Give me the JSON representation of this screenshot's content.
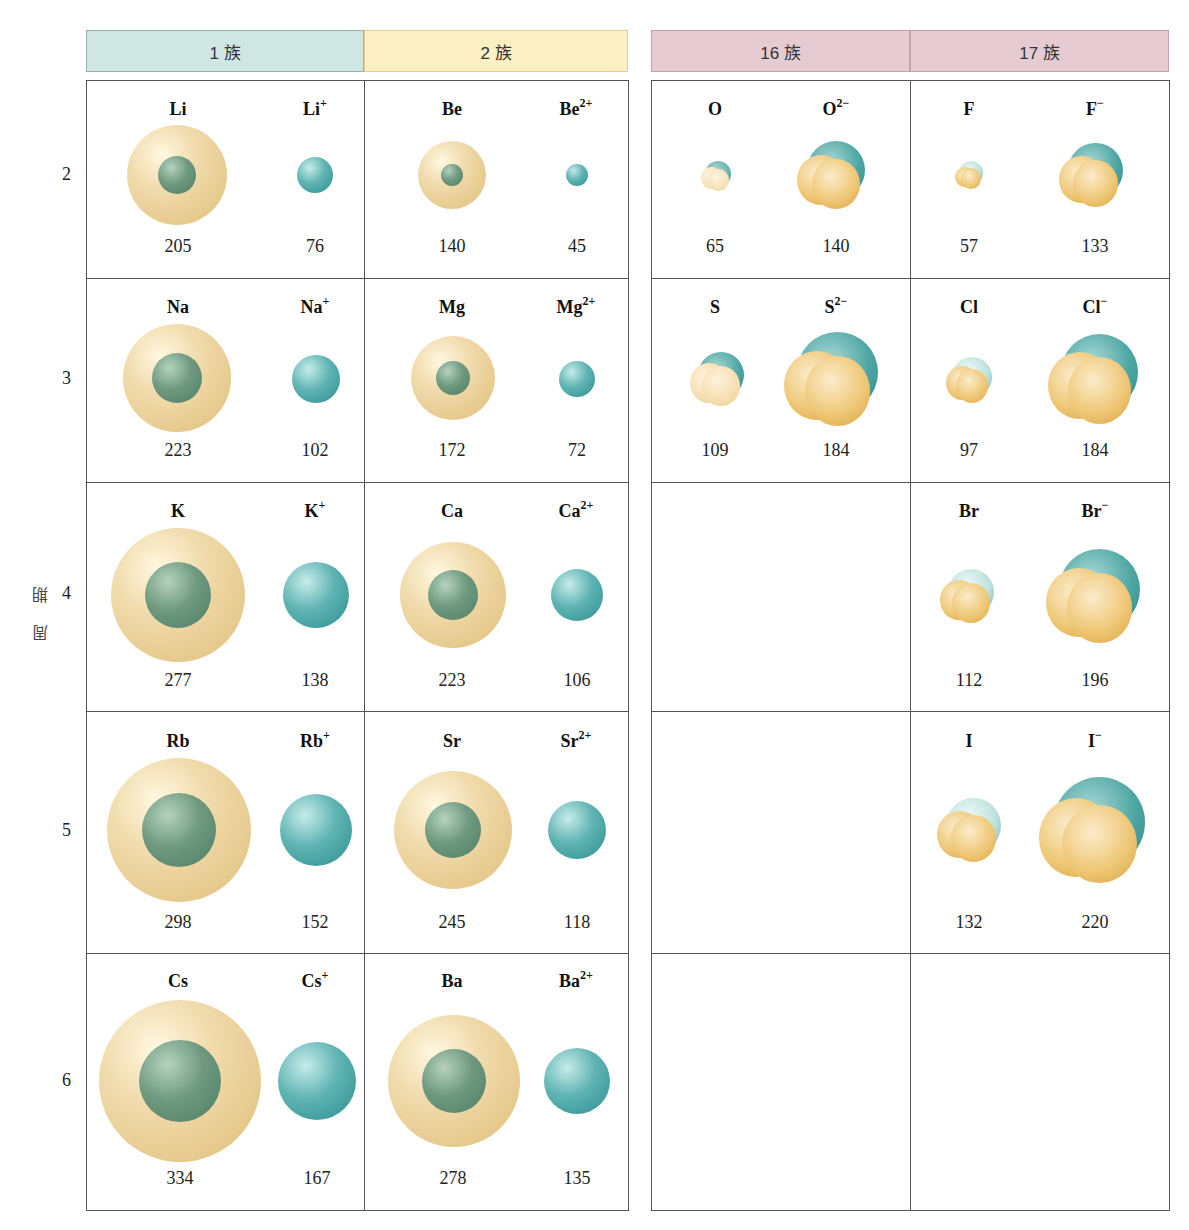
{
  "group_headers": [
    {
      "id": "g1",
      "label": "1 族"
    },
    {
      "id": "g2",
      "label": "2 族"
    },
    {
      "id": "g16",
      "label": "16 族"
    },
    {
      "id": "g17",
      "label": "17 族"
    }
  ],
  "axis_label": "周期",
  "periods": [
    "2",
    "3",
    "4",
    "5",
    "6"
  ],
  "colors": {
    "group1_header": "#cfe6e3",
    "group2_header": "#fbefc4",
    "group16_17_header": "#e7cbd3",
    "atom_shell": "#e6c98c",
    "atom_core": "#5f8c73",
    "cation": "#3e9c9d",
    "anion_gold": "#e9be62",
    "anion_teal": "#3f9a9a"
  },
  "cells": {
    "g1": [
      {
        "atom": "Li",
        "ion": "Li",
        "charge": "+",
        "atom_r": "205",
        "ion_r": "76"
      },
      {
        "atom": "Na",
        "ion": "Na",
        "charge": "+",
        "atom_r": "223",
        "ion_r": "102"
      },
      {
        "atom": "K",
        "ion": "K",
        "charge": "+",
        "atom_r": "277",
        "ion_r": "138"
      },
      {
        "atom": "Rb",
        "ion": "Rb",
        "charge": "+",
        "atom_r": "298",
        "ion_r": "152"
      },
      {
        "atom": "Cs",
        "ion": "Cs",
        "charge": "+",
        "atom_r": "334",
        "ion_r": "167"
      }
    ],
    "g2": [
      {
        "atom": "Be",
        "ion": "Be",
        "charge": "2+",
        "atom_r": "140",
        "ion_r": "45"
      },
      {
        "atom": "Mg",
        "ion": "Mg",
        "charge": "2+",
        "atom_r": "172",
        "ion_r": "72"
      },
      {
        "atom": "Ca",
        "ion": "Ca",
        "charge": "2+",
        "atom_r": "223",
        "ion_r": "106"
      },
      {
        "atom": "Sr",
        "ion": "Sr",
        "charge": "2+",
        "atom_r": "245",
        "ion_r": "118"
      },
      {
        "atom": "Ba",
        "ion": "Ba",
        "charge": "2+",
        "atom_r": "278",
        "ion_r": "135"
      }
    ],
    "g16": [
      {
        "atom": "O",
        "ion": "O",
        "charge": "2−",
        "atom_r": "65",
        "ion_r": "140"
      },
      {
        "atom": "S",
        "ion": "S",
        "charge": "2−",
        "atom_r": "109",
        "ion_r": "184"
      }
    ],
    "g17": [
      {
        "atom": "F",
        "ion": "F",
        "charge": "−",
        "atom_r": "57",
        "ion_r": "133"
      },
      {
        "atom": "Cl",
        "ion": "Cl",
        "charge": "−",
        "atom_r": "97",
        "ion_r": "184"
      },
      {
        "atom": "Br",
        "ion": "Br",
        "charge": "−",
        "atom_r": "112",
        "ion_r": "196"
      },
      {
        "atom": "I",
        "ion": "I",
        "charge": "−",
        "atom_r": "132",
        "ion_r": "220"
      }
    ]
  }
}
